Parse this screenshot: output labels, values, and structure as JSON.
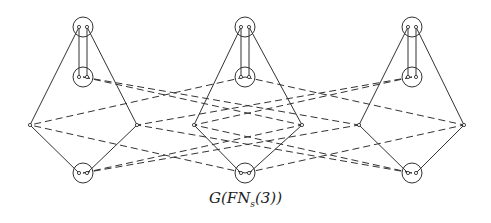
{
  "caption": {
    "main": "G(FN",
    "sub": "s",
    "tail": "(3))"
  },
  "colors": {
    "stroke": "#333333",
    "background": "#ffffff"
  },
  "clusters": [
    {
      "top": [
        83,
        27
      ],
      "mid": [
        83,
        77
      ],
      "bottom": [
        83,
        173
      ],
      "left": [
        30,
        125
      ],
      "right": [
        137,
        125
      ]
    },
    {
      "top": [
        245,
        27
      ],
      "mid": [
        245,
        77
      ],
      "bottom": [
        245,
        173
      ],
      "left": [
        194,
        125
      ],
      "right": [
        302,
        125
      ]
    },
    {
      "top": [
        412,
        27
      ],
      "mid": [
        412,
        77
      ],
      "bottom": [
        412,
        173
      ],
      "left": [
        359,
        125
      ],
      "right": [
        464,
        125
      ]
    }
  ],
  "dashed_edges": [
    [
      [
        83,
        77
      ],
      [
        302,
        125
      ]
    ],
    [
      [
        83,
        77
      ],
      [
        359,
        125
      ]
    ],
    [
      [
        245,
        77
      ],
      [
        30,
        125
      ]
    ],
    [
      [
        245,
        77
      ],
      [
        464,
        125
      ]
    ],
    [
      [
        412,
        77
      ],
      [
        137,
        125
      ]
    ],
    [
      [
        412,
        77
      ],
      [
        194,
        125
      ]
    ],
    [
      [
        83,
        173
      ],
      [
        302,
        125
      ]
    ],
    [
      [
        83,
        173
      ],
      [
        359,
        125
      ]
    ],
    [
      [
        245,
        173
      ],
      [
        30,
        125
      ]
    ],
    [
      [
        245,
        173
      ],
      [
        464,
        125
      ]
    ],
    [
      [
        412,
        173
      ],
      [
        137,
        125
      ]
    ],
    [
      [
        412,
        173
      ],
      [
        194,
        125
      ]
    ]
  ]
}
